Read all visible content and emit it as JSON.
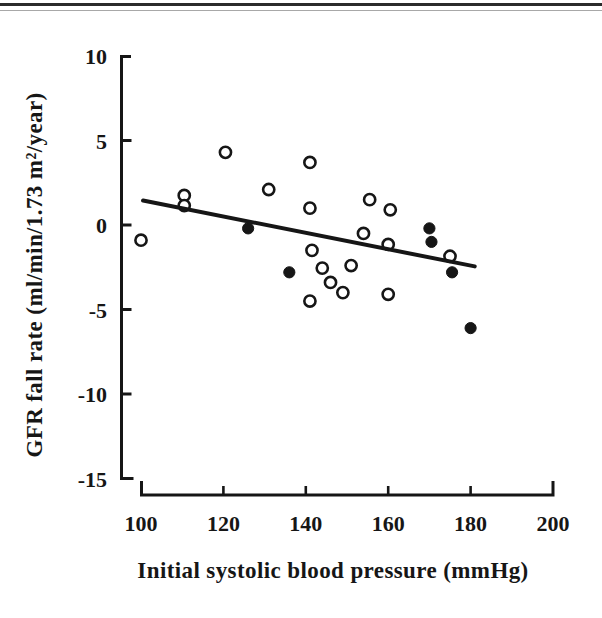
{
  "page": {
    "background": "#ffffff",
    "ink": "#161616"
  },
  "top_rules": {
    "primary_color": "#2b2b2b",
    "secondary_color": "#a8a8a8"
  },
  "chart_data": {
    "type": "scatter",
    "title": "",
    "xlabel": "Initial systolic blood pressure (mmHg)",
    "ylabel": "GFR fall rate (ml/min/1.73 m²/year)",
    "xlim": [
      100,
      200
    ],
    "ylim": [
      -15,
      10
    ],
    "xticks": [
      100,
      120,
      140,
      160,
      180,
      200
    ],
    "yticks": [
      10,
      5,
      0,
      -5,
      -10,
      -15
    ],
    "grid": false,
    "legend": "none",
    "marker_colors": {
      "open": "#ffffff",
      "filled": "#161616",
      "stroke": "#161616"
    },
    "series": [
      {
        "name": "open-circles",
        "marker": "open-circle",
        "points": [
          [
            100,
            -0.9
          ],
          [
            110.5,
            1.75
          ],
          [
            110.5,
            1.15
          ],
          [
            120.5,
            4.3
          ],
          [
            131,
            2.1
          ],
          [
            141,
            3.7
          ],
          [
            141,
            1.0
          ],
          [
            155.5,
            1.5
          ],
          [
            160.5,
            0.9
          ],
          [
            154,
            -0.5
          ],
          [
            160,
            -1.15
          ],
          [
            141.5,
            -1.5
          ],
          [
            144,
            -2.55
          ],
          [
            151,
            -2.4
          ],
          [
            146,
            -3.4
          ],
          [
            149,
            -4.0
          ],
          [
            141,
            -4.5
          ],
          [
            160,
            -4.1
          ],
          [
            175,
            -1.85
          ]
        ]
      },
      {
        "name": "filled-circles",
        "marker": "filled-circle",
        "points": [
          [
            126,
            -0.2
          ],
          [
            136,
            -2.8
          ],
          [
            170,
            -0.2
          ],
          [
            170.5,
            -1.0
          ],
          [
            175.5,
            -2.8
          ],
          [
            180,
            -6.1
          ]
        ]
      }
    ],
    "trend_line": {
      "x1": 100.5,
      "y1": 1.45,
      "x2": 181,
      "y2": -2.45
    }
  }
}
